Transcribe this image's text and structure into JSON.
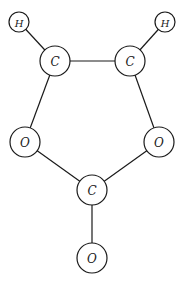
{
  "diagram": {
    "type": "molecular-graph",
    "nodes": [
      {
        "id": "H1",
        "label": "H",
        "x": 19,
        "y": 22,
        "r": 10
      },
      {
        "id": "H2",
        "label": "H",
        "x": 165,
        "y": 22,
        "r": 10
      },
      {
        "id": "C1",
        "label": "C",
        "x": 55,
        "y": 61,
        "r": 15
      },
      {
        "id": "C2",
        "label": "C",
        "x": 130,
        "y": 61,
        "r": 15
      },
      {
        "id": "O1",
        "label": "O",
        "x": 25,
        "y": 142,
        "r": 15
      },
      {
        "id": "O2",
        "label": "O",
        "x": 159,
        "y": 142,
        "r": 15
      },
      {
        "id": "C3",
        "label": "C",
        "x": 92,
        "y": 190,
        "r": 15
      },
      {
        "id": "O3",
        "label": "O",
        "x": 92,
        "y": 258,
        "r": 15
      }
    ],
    "edges": [
      [
        "H1",
        "C1"
      ],
      [
        "H2",
        "C2"
      ],
      [
        "C1",
        "C2"
      ],
      [
        "C1",
        "O1"
      ],
      [
        "C2",
        "O2"
      ],
      [
        "O1",
        "C3"
      ],
      [
        "O2",
        "C3"
      ],
      [
        "C3",
        "O3"
      ]
    ]
  }
}
